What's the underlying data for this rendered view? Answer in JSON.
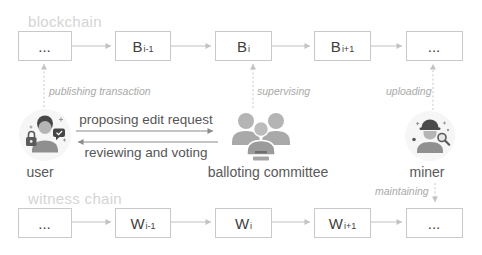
{
  "figure": {
    "blockchain": {
      "label": "blockchain",
      "blocks": [
        {
          "main": "...",
          "sub": ""
        },
        {
          "main": "B",
          "sub": "i-1"
        },
        {
          "main": "B",
          "sub": "i"
        },
        {
          "main": "B",
          "sub": "i+1"
        },
        {
          "main": "...",
          "sub": ""
        }
      ]
    },
    "witness_chain": {
      "label": "witness chain",
      "blocks": [
        {
          "main": "...",
          "sub": ""
        },
        {
          "main": "W",
          "sub": "i-1"
        },
        {
          "main": "W",
          "sub": "i"
        },
        {
          "main": "W",
          "sub": "i+1"
        },
        {
          "main": "...",
          "sub": ""
        }
      ]
    },
    "actors": {
      "user": "user",
      "committee": "balloting committee",
      "miner": "miner"
    },
    "edges": {
      "publishing_transaction": "publishing transaction",
      "supervising": "supervising",
      "uploading": "uploading",
      "maintaining": "maintaining",
      "proposing_edit_request": "proposing edit request",
      "reviewing_and_voting": "reviewing and voting"
    },
    "icons": {
      "user": "user-icon",
      "committee": "balloting-committee-icon",
      "miner": "miner-icon"
    },
    "colors": {
      "chain_label": "#d4d4d4",
      "box_border": "#c9c9c9",
      "box_text": "#3f3f3f",
      "edge_label": "#a9a9a9",
      "actor_label": "#595959",
      "arrow_light": "#c2c2c2",
      "arrow_mid": "#8a8a8a"
    }
  }
}
